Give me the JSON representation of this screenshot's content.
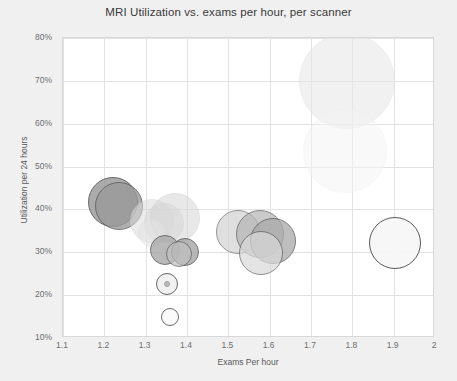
{
  "chart_data": {
    "type": "scatter",
    "title": "MRI Utilization vs. exams per hour, per scanner",
    "xlabel": "Exams Per hour",
    "ylabel": "Utilization per 24 hours",
    "xlim": [
      1.1,
      2.0
    ],
    "ylim": [
      0.1,
      0.8
    ],
    "grid": true,
    "legend": "none",
    "xticks": [
      "1.1",
      "1.2",
      "1.3",
      "1.4",
      "1.5",
      "1.6",
      "1.7",
      "1.8",
      "1.9",
      "2"
    ],
    "xtick_values": [
      1.1,
      1.2,
      1.3,
      1.4,
      1.5,
      1.6,
      1.7,
      1.8,
      1.9,
      2.0
    ],
    "yticks": [
      "10%",
      "20%",
      "30%",
      "40%",
      "50%",
      "60%",
      "70%",
      "80%"
    ],
    "ytick_values": [
      0.1,
      0.2,
      0.3,
      0.4,
      0.5,
      0.6,
      0.7,
      0.8
    ],
    "size_encoding": "bubble radius encodes scanner exam volume",
    "points": [
      {
        "x": 1.221,
        "y": 0.418,
        "r": 25,
        "fill": "#9d9d9d",
        "stroke": "#4f4f4f",
        "opacity": 0.85
      },
      {
        "x": 1.236,
        "y": 0.409,
        "r": 24,
        "fill": "#9a9a9a",
        "stroke": "#5a5a5a",
        "opacity": 0.8
      },
      {
        "x": 1.316,
        "y": 0.372,
        "r": 22,
        "fill": "#dcdcdc",
        "stroke": "#d2d2d2",
        "opacity": 0.55
      },
      {
        "x": 1.345,
        "y": 0.368,
        "r": 20,
        "fill": "#d8d8d8",
        "stroke": "#cfcfcf",
        "opacity": 0.55
      },
      {
        "x": 1.372,
        "y": 0.381,
        "r": 25,
        "fill": "#d6d6d6",
        "stroke": "#cccccc",
        "opacity": 0.55
      },
      {
        "x": 1.316,
        "y": 0.345,
        "r": 14,
        "fill": "#e4e4e4",
        "stroke": "#dddddd",
        "opacity": 0.5
      },
      {
        "x": 1.347,
        "y": 0.306,
        "r": 15,
        "fill": "#a8a8a8",
        "stroke": "#545454",
        "opacity": 0.8
      },
      {
        "x": 1.396,
        "y": 0.301,
        "r": 14,
        "fill": "#a6a6a6",
        "stroke": "#545454",
        "opacity": 0.8
      },
      {
        "x": 1.381,
        "y": 0.297,
        "r": 13,
        "fill": "#c0c0c0",
        "stroke": "#5d5d5d",
        "opacity": 0.7
      },
      {
        "x": 1.352,
        "y": 0.225,
        "r": 11,
        "fill": "#f0f0f0",
        "stroke": "#585858",
        "opacity": 0.9
      },
      {
        "x": 1.352,
        "y": 0.225,
        "r": 3,
        "fill": "#b5b5b5",
        "stroke": "#9a9a9a",
        "opacity": 0.9
      },
      {
        "x": 1.36,
        "y": 0.15,
        "r": 9,
        "fill": "#fbfbfb",
        "stroke": "#5c5c5c",
        "opacity": 0.9
      },
      {
        "x": 1.523,
        "y": 0.348,
        "r": 22,
        "fill": "#d2d2d2",
        "stroke": "#6a6a6a",
        "opacity": 0.7
      },
      {
        "x": 1.577,
        "y": 0.342,
        "r": 24,
        "fill": "#b4b4b4",
        "stroke": "#585858",
        "opacity": 0.7
      },
      {
        "x": 1.608,
        "y": 0.327,
        "r": 23,
        "fill": "#a9a9a9",
        "stroke": "#545454",
        "opacity": 0.75
      },
      {
        "x": 1.578,
        "y": 0.299,
        "r": 22,
        "fill": "#dadada",
        "stroke": "#5e5e5e",
        "opacity": 0.7
      },
      {
        "x": 1.786,
        "y": 0.7,
        "r": 48,
        "fill": "#e8e8e8",
        "stroke": "#e2e2e2",
        "opacity": 0.6
      },
      {
        "x": 1.782,
        "y": 0.537,
        "r": 42,
        "fill": "#f4f4f4",
        "stroke": "#f0f0f0",
        "opacity": 0.5
      },
      {
        "x": 1.903,
        "y": 0.321,
        "r": 26,
        "fill": "#f7f7f7",
        "stroke": "#525252",
        "opacity": 0.95
      }
    ]
  },
  "axis": {
    "title": "MRI Utilization vs. exams per hour, per scanner",
    "x_title": "Exams Per hour",
    "y_title": "Utilization per 24 hours"
  }
}
